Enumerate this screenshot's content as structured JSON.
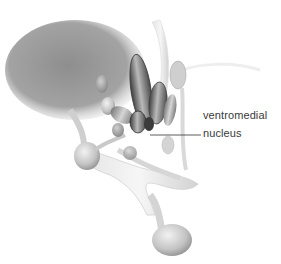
{
  "figure": {
    "labels": [
      {
        "id": "ventromedial",
        "text": "ventromedial"
      },
      {
        "id": "nucleus",
        "text": "nucleus"
      }
    ],
    "leader_line": {
      "x1": 150,
      "y1": 135,
      "x2": 201,
      "y2": 135,
      "color": "#333333"
    },
    "colors": {
      "background": "#ffffff",
      "mass_gray": "#9a9a9a",
      "nucleus_dark": "#4a4a4a",
      "structure_light": "#d8d8d8",
      "label_text": "#3a3a3a"
    }
  }
}
